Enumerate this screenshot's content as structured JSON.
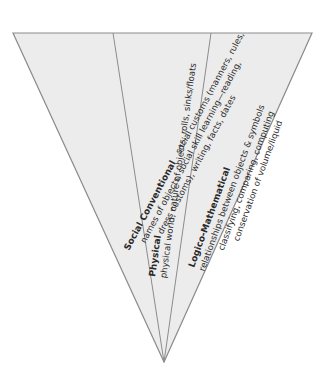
{
  "diagram": {
    "shape": "inverted-triangle",
    "colors": {
      "fill": "#ececec",
      "stroke": "#8c8c8c",
      "text": "#2a2a2a",
      "background": "#ffffff"
    },
    "sections": [
      {
        "id": "social-conventional",
        "title": "Social Conventional",
        "lines": [
          "social customs (manners, rules,",
          "names of objects, social skill learning—reading,",
          "dress customs), writing, facts, dates"
        ]
      },
      {
        "id": "physical",
        "title": "Physical",
        "lines": [
          "physical world, nature of objects, rolls, sinks/floats"
        ]
      },
      {
        "id": "logico-mathematical",
        "title": "Logico-Mathematical",
        "lines": [
          "relationships between objects & symbols",
          "classifying, comparing, computing",
          "conservation of volume/liquid"
        ]
      }
    ]
  }
}
